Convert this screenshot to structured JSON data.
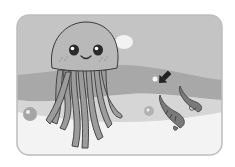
{
  "illustration": {
    "subject": "jellyfish",
    "secondary": "shrimp",
    "shrimp_count": 2,
    "has_arrow": true,
    "colors": {
      "background": "#ffffff",
      "card_sky": "#c4c4c4",
      "band_dark": "#a9a9a9",
      "band_mid": "#d6d6d6",
      "floor": "#f3f3f3",
      "jelly_body": "#b9b9b9",
      "tentacle": "#9c9c9c",
      "outline": "#3a3a3a",
      "arrow": "#222222",
      "shrimp": "#7a7a7a"
    }
  }
}
